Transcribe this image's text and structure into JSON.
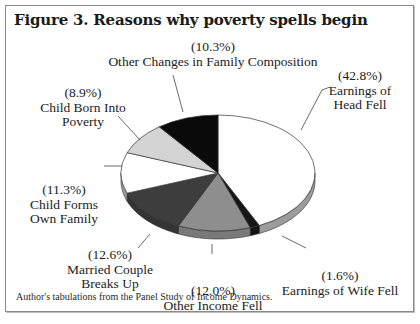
{
  "chart_data": {
    "type": "pie",
    "title": "Figure 3. Reasons why poverty spells begin",
    "note": "Author's tabulations from the Panel Study of Income Dynamics.",
    "slices": [
      {
        "label": "Earnings of Head Fell",
        "label_lines": [
          "Earnings of",
          "Head Fell"
        ],
        "pct_text": "(42.8%)",
        "value": 42.8,
        "color": "#ffffff"
      },
      {
        "label": "Earnings of Wife Fell",
        "label_lines": [
          "Earnings of Wife Fell"
        ],
        "pct_text": "(1.6%)",
        "value": 1.6,
        "color": "#161616"
      },
      {
        "label": "Other Income Fell",
        "label_lines": [
          "Other Income Fell"
        ],
        "pct_text": "(12.0%)",
        "value": 12.0,
        "color": "#8e8e8e"
      },
      {
        "label": "Married Couple Breaks Up",
        "label_lines": [
          "Married Couple",
          "Breaks Up"
        ],
        "pct_text": "(12.6%)",
        "value": 12.6,
        "color": "#3d3d3d"
      },
      {
        "label": "Child Forms Own Family",
        "label_lines": [
          "Child Forms",
          "Own Family"
        ],
        "pct_text": "(11.3%)",
        "value": 11.3,
        "color": "#ffffff"
      },
      {
        "label": "Child Born Into Poverty",
        "label_lines": [
          "Child Born Into",
          "Poverty"
        ],
        "pct_text": "(8.9%)",
        "value": 8.9,
        "color": "#d4d4d4"
      },
      {
        "label": "Other Changes in Family Composition",
        "label_lines": [
          "Other Changes in Family Composition"
        ],
        "pct_text": "(10.3%)",
        "value": 10.3,
        "color": "#0a0a0a"
      }
    ],
    "start": "12 o'clock",
    "direction": "clockwise",
    "style": "3d-tilted"
  }
}
